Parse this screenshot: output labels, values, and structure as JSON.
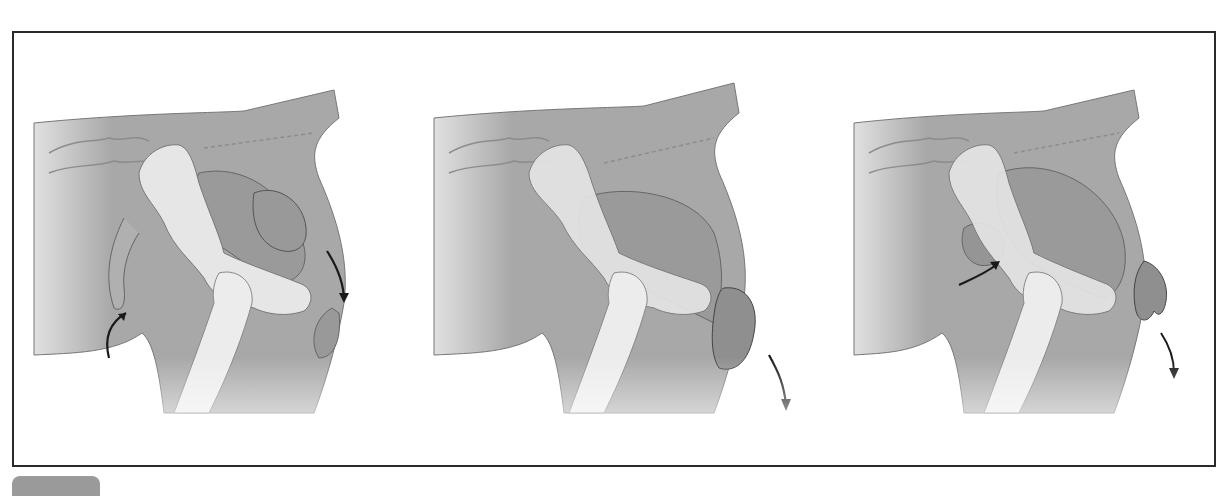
{
  "figure": {
    "type": "three-panel anatomical illustration",
    "panels": [
      {
        "index": 1,
        "description": "Calf inside uterus beyond pelvis; forelegs flexed backward",
        "arrows": [
          {
            "name": "upward-curved-arrow",
            "position": "lower-left of pelvis"
          },
          {
            "name": "downward-curved-arrow",
            "position": "right side near vulva"
          }
        ]
      },
      {
        "index": 2,
        "description": "Calf head emerging through vulva",
        "arrows": [
          {
            "name": "downward-curved-arrow",
            "position": "below emerging head"
          }
        ]
      },
      {
        "index": 3,
        "description": "Calf limb extended out through vulva; head repositioned",
        "arrows": [
          {
            "name": "upward-curved-arrow",
            "position": "left of pelvis"
          },
          {
            "name": "downward-curved-arrow",
            "position": "below emerging limb"
          }
        ]
      }
    ],
    "colors": {
      "frame_border": "#2a2a2a",
      "body_fill": "#a8a8a8",
      "bone_fill": "#e6e6e6",
      "outline": "#6e6e6e",
      "arrow": "#1a1a1a",
      "label_tab": "#9a9a9a"
    },
    "label_tab": {
      "text": ""
    }
  }
}
